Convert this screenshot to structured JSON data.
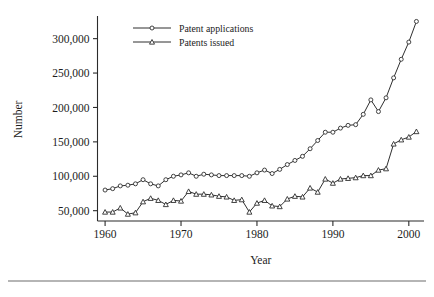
{
  "chart_data": {
    "type": "line",
    "title": "",
    "xlabel": "Year",
    "ylabel": "Number",
    "xlim": [
      1959,
      2002
    ],
    "ylim": [
      35000,
      330000
    ],
    "grid": false,
    "legend_position": "top-left",
    "xticks": [
      "1960",
      "1970",
      "1980",
      "1990",
      "2000"
    ],
    "xtick_values": [
      1960,
      1970,
      1980,
      1990,
      2000
    ],
    "yticks": [
      "50,000",
      "100,000",
      "150,000",
      "200,000",
      "250,000",
      "300,000"
    ],
    "ytick_values": [
      50000,
      100000,
      150000,
      200000,
      250000,
      300000
    ],
    "x": [
      1960,
      1961,
      1962,
      1963,
      1964,
      1965,
      1966,
      1967,
      1968,
      1969,
      1970,
      1971,
      1972,
      1973,
      1974,
      1975,
      1976,
      1977,
      1978,
      1979,
      1980,
      1981,
      1982,
      1983,
      1984,
      1985,
      1986,
      1987,
      1988,
      1989,
      1990,
      1991,
      1992,
      1993,
      1994,
      1995,
      1996,
      1997,
      1998,
      1999,
      2000,
      2001
    ],
    "series": [
      {
        "name": "Patent applications",
        "marker": "circle",
        "values": [
          80000,
          82000,
          86000,
          87000,
          89000,
          95000,
          89000,
          86000,
          95000,
          100000,
          102000,
          105000,
          100000,
          103000,
          102000,
          101000,
          101000,
          101000,
          101000,
          100000,
          105000,
          109000,
          104000,
          110000,
          117000,
          123000,
          129000,
          140000,
          152000,
          164000,
          164000,
          170000,
          174000,
          175000,
          190000,
          211000,
          194000,
          214000,
          243000,
          270000,
          295000,
          325000
        ]
      },
      {
        "name": "Patents issued",
        "marker": "triangle",
        "values": [
          48000,
          48000,
          54000,
          45000,
          47000,
          63000,
          68000,
          65000,
          59000,
          65000,
          64000,
          78000,
          74000,
          74000,
          73000,
          71000,
          70000,
          65000,
          66000,
          48000,
          61000,
          65000,
          57000,
          56000,
          67000,
          71000,
          70000,
          83000,
          77000,
          96000,
          90000,
          96000,
          97000,
          98000,
          101000,
          101000,
          109000,
          111000,
          147000,
          153000,
          157000,
          165000
        ]
      }
    ]
  },
  "legend": {
    "items": [
      {
        "label": "Patent applications"
      },
      {
        "label": "Patents issued"
      }
    ]
  },
  "colors": {
    "line": "#2f2f2f",
    "axis": "#2b2b2b",
    "text": "#1c1c1c",
    "background": "#ffffff",
    "rule": "#6d6d6d"
  }
}
